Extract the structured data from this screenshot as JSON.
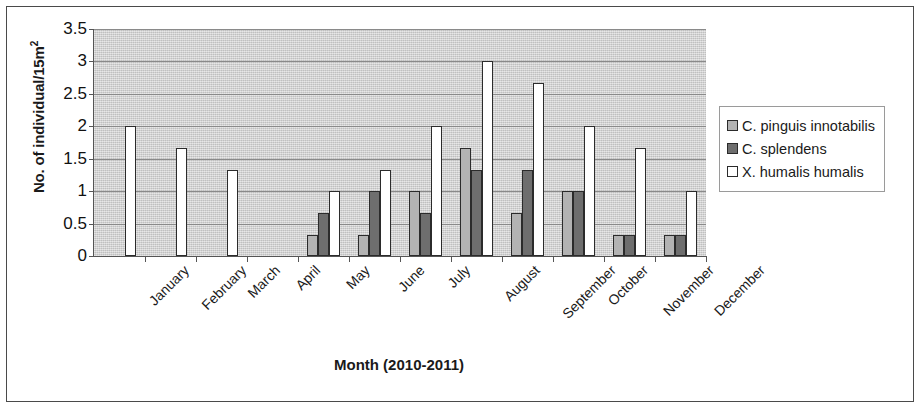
{
  "chart_data": {
    "type": "bar",
    "title": "",
    "xlabel": "Month (2010-2011)",
    "ylabel": "No. of individual/15m2",
    "ylabel_base": "No. of individual/15m",
    "ylabel_sup": "2",
    "categories": [
      "January",
      "February",
      "March",
      "April",
      "May",
      "June",
      "July",
      "August",
      "September",
      "October",
      "November",
      "December"
    ],
    "series": [
      {
        "name": "C. pinguis innotabilis",
        "color": "#b3b3b3",
        "values": [
          0,
          0,
          0,
          0,
          0.33,
          0.33,
          1.0,
          1.67,
          0.67,
          1.0,
          0.33,
          0.33
        ]
      },
      {
        "name": "C. splendens",
        "color": "#6e6e6e",
        "values": [
          0,
          0,
          0,
          0,
          0.67,
          1.0,
          0.67,
          1.33,
          1.33,
          1.0,
          0.33,
          0.33
        ]
      },
      {
        "name": "X. humalis humalis",
        "color": "#ffffff",
        "values": [
          2.0,
          1.67,
          1.33,
          0,
          1.0,
          1.33,
          2.0,
          3.0,
          2.67,
          2.0,
          1.67,
          1.0
        ]
      }
    ],
    "ylim": [
      0,
      3.5
    ],
    "yticks": [
      0,
      0.5,
      1,
      1.5,
      2,
      2.5,
      3,
      3.5
    ],
    "ytick_labels": [
      "0",
      "0.5",
      "1",
      "1.5",
      "2",
      "2.5",
      "3",
      "3.5"
    ],
    "grid": true,
    "legend_position": "right",
    "plot_background": "#d2d2d2"
  }
}
